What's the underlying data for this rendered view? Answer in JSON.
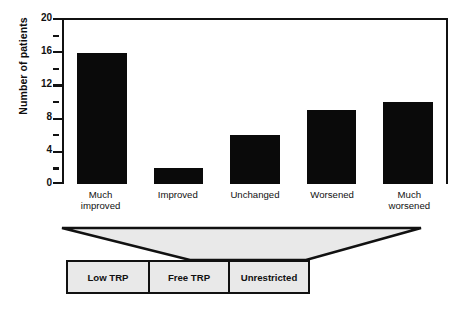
{
  "chart_data": {
    "type": "bar",
    "title": "",
    "xlabel": "",
    "ylabel": "Number of patients",
    "categories": [
      "Much improved",
      "Improved",
      "Unchanged",
      "Worsened",
      "Much worsened"
    ],
    "values": [
      16,
      2,
      6,
      9,
      10
    ],
    "ylim": [
      0,
      20
    ],
    "ymajor_ticks": [
      0,
      4,
      8,
      12,
      16,
      20
    ],
    "yminor_ticks": [
      2,
      6,
      10,
      14,
      18
    ],
    "ytick_labels": [
      "0",
      "4",
      "8",
      "12",
      "16",
      "20"
    ],
    "grid": false,
    "legend": "none",
    "bar_color": "#0a0a0a",
    "axis_color": "#111111",
    "background": "#ffffff"
  },
  "axis": {
    "y_title": "Number of patients",
    "labels": [
      {
        "value": 20,
        "text": "20"
      },
      {
        "value": 16,
        "text": "16"
      },
      {
        "value": 12,
        "text": "12"
      },
      {
        "value": 8,
        "text": "8"
      },
      {
        "value": 4,
        "text": "4"
      },
      {
        "value": 0,
        "text": "0"
      }
    ]
  },
  "categories": [
    {
      "line1": "Much",
      "line2": "improved"
    },
    {
      "line1": "Improved",
      "line2": ""
    },
    {
      "line1": "Unchanged",
      "line2": ""
    },
    {
      "line1": "Worsened",
      "line2": ""
    },
    {
      "line1": "Much",
      "line2": "worsened"
    }
  ],
  "funnel": {
    "fill_color": "#e9e9e9",
    "edge_color": "#111111"
  },
  "treatment_boxes": {
    "fill_color": "#e9e9e9",
    "border_color": "#111111",
    "items": [
      {
        "label": "Low TRP"
      },
      {
        "label": "Free TRP"
      },
      {
        "label": "Unrestricted"
      }
    ]
  }
}
